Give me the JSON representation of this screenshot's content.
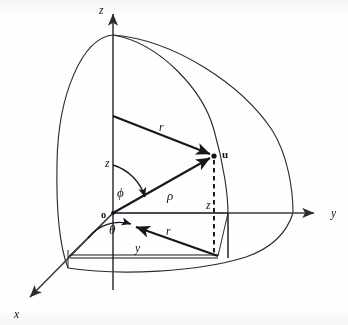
{
  "axes": [
    {
      "name": "z",
      "label": "z",
      "label_x": 99,
      "label_y": 14,
      "from": [
        113,
        295
      ],
      "to": [
        113,
        10
      ]
    },
    {
      "name": "y",
      "label": "y",
      "label_x": 331,
      "label_y": 217,
      "from": [
        113,
        213
      ],
      "to": [
        320,
        213
      ]
    },
    {
      "name": "x",
      "label": "x",
      "label_x": 14,
      "label_y": 318,
      "from": [
        113,
        213
      ],
      "to": [
        26,
        301
      ]
    }
  ],
  "point": {
    "name": "u",
    "label": "u",
    "x": 214,
    "y": 156,
    "label_x": 222,
    "label_y": 158
  },
  "origin": {
    "name": "o",
    "label": "o",
    "x": 113,
    "y": 213,
    "label_x": 101,
    "label_y": 218
  },
  "segments": [
    {
      "name": "radius-r-upper",
      "label": "r",
      "label_x": 159,
      "label_y": 131,
      "from": [
        113,
        116
      ],
      "to": [
        214,
        156
      ]
    },
    {
      "name": "radius-rho",
      "label": "ρ",
      "label_x": 167,
      "label_y": 200,
      "from": [
        113,
        213
      ],
      "to": [
        214,
        156
      ]
    },
    {
      "name": "radius-r-lower",
      "label": "r",
      "label_x": 166,
      "label_y": 235,
      "from": [
        218,
        256
      ],
      "to": [
        133,
        226
      ]
    },
    {
      "name": "height-z-axis",
      "label": "z",
      "label_x": 105,
      "label_y": 167
    },
    {
      "name": "height-z-dashed",
      "label": "z",
      "label_x": 206,
      "label_y": 209
    },
    {
      "name": "base-y",
      "label": "y",
      "label_x": 135,
      "label_y": 252
    }
  ],
  "angles": [
    {
      "name": "phi",
      "label": "ϕ",
      "label_x": 117,
      "label_y": 197
    },
    {
      "name": "theta",
      "label": "θ",
      "label_x": 109,
      "label_y": 234
    }
  ],
  "colors": {
    "ink": "#16161c",
    "axis": "#3b3b44",
    "arc": "#2b2b33",
    "background": "#fefefe"
  }
}
